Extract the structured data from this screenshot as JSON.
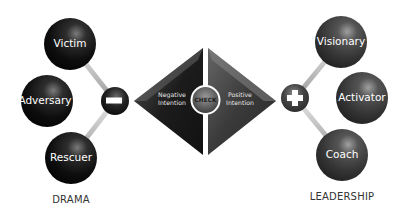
{
  "diagram": {
    "left_group": {
      "label": "DRAMA",
      "connector_symbol": "minus",
      "nodes": [
        {
          "label": "Victim"
        },
        {
          "label": "Adversary"
        },
        {
          "label": "Rescuer"
        }
      ]
    },
    "center": {
      "left_text_line1": "Negative",
      "left_text_line2": "Intention",
      "center_label": "CHECK",
      "right_text_line1": "Positive",
      "right_text_line2": "Intention"
    },
    "right_group": {
      "label": "LEADERSHIP",
      "connector_symbol": "plus",
      "nodes": [
        {
          "label": "Visionary"
        },
        {
          "label": "Activator"
        },
        {
          "label": "Coach"
        }
      ]
    },
    "colors": {
      "sphere_dark": "#111111",
      "sphere_right": "#3a3a3a",
      "rod": "#c8c8c8",
      "label_text": "#333333",
      "background": "#ffffff"
    }
  }
}
